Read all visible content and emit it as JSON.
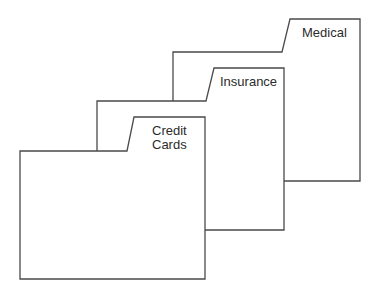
{
  "diagram": {
    "title": "",
    "stroke_color": "#4a4a4a",
    "background": "#ffffff",
    "folders": [
      {
        "label": "Medical",
        "order": "back",
        "body": {
          "left": 173,
          "top": 52,
          "right": 360,
          "bottom": 181
        },
        "tab": {
          "slant_bottom_x": 282,
          "slant_top_x": 290,
          "top": 19
        }
      },
      {
        "label": "Insurance",
        "order": "middle",
        "body": {
          "left": 97,
          "top": 101,
          "right": 284,
          "bottom": 230
        },
        "tab": {
          "slant_bottom_x": 206,
          "slant_top_x": 214,
          "top": 68
        }
      },
      {
        "label": "Credit\nCards",
        "order": "front",
        "body": {
          "left": 20,
          "top": 151,
          "right": 205,
          "bottom": 279
        },
        "tab": {
          "slant_bottom_x": 127,
          "slant_top_x": 134,
          "top": 117
        }
      }
    ]
  }
}
